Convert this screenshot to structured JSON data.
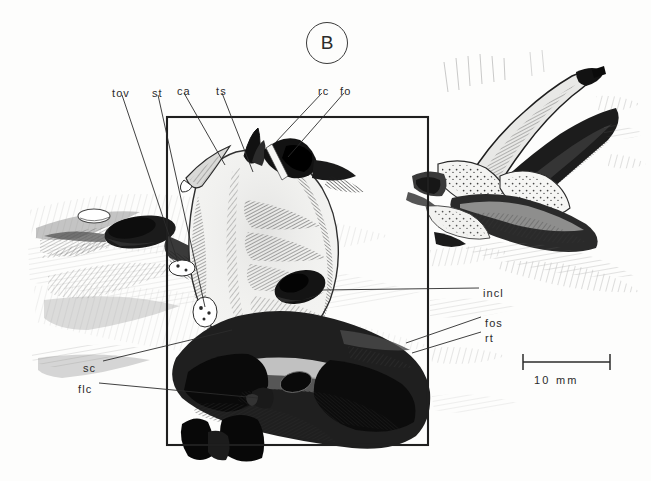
{
  "figure": {
    "panel_letter": "B",
    "caption_labels": [
      {
        "id": "tov",
        "text": "tov",
        "x": 112,
        "y": 88
      },
      {
        "id": "st",
        "text": "st",
        "x": 152,
        "y": 88
      },
      {
        "id": "ca",
        "text": "ca",
        "x": 177,
        "y": 86
      },
      {
        "id": "ts",
        "text": "ts",
        "x": 216,
        "y": 86
      },
      {
        "id": "rc",
        "text": "rc",
        "x": 318,
        "y": 86
      },
      {
        "id": "fo",
        "text": "fo",
        "x": 340,
        "y": 86
      },
      {
        "id": "incl",
        "text": "incl",
        "x": 483,
        "y": 288
      },
      {
        "id": "fos",
        "text": "fos",
        "x": 485,
        "y": 318
      },
      {
        "id": "rt",
        "text": "rt",
        "x": 485,
        "y": 333
      },
      {
        "id": "sc",
        "text": "sc",
        "x": 83,
        "y": 363
      },
      {
        "id": "flc",
        "text": "flc",
        "x": 78,
        "y": 384
      }
    ],
    "scale_bar": {
      "label": "10 mm",
      "x1": 523,
      "x2": 610,
      "y": 362,
      "text_x": 534,
      "text_y": 374
    },
    "frame_box": {
      "x": 167,
      "y": 117,
      "w": 261,
      "h": 328
    },
    "colors": {
      "ink": "#2b2b2b",
      "line": "#3a3a3a",
      "paper": "#fdfdfc",
      "shadow": "#6e6e6e",
      "deep_shadow": "#151515"
    },
    "leader_lines": [
      {
        "id": "tov",
        "x1": 122,
        "y1": 95,
        "x2": 178,
        "y2": 262
      },
      {
        "id": "st",
        "x1": 158,
        "y1": 95,
        "x2": 205,
        "y2": 307
      },
      {
        "id": "ca",
        "x1": 184,
        "y1": 93,
        "x2": 225,
        "y2": 165
      },
      {
        "id": "ts",
        "x1": 222,
        "y1": 93,
        "x2": 253,
        "y2": 172
      },
      {
        "id": "rc",
        "x1": 322,
        "y1": 93,
        "x2": 275,
        "y2": 143
      },
      {
        "id": "fo",
        "x1": 344,
        "y1": 93,
        "x2": 288,
        "y2": 157
      },
      {
        "id": "incl",
        "x1": 479,
        "y1": 288,
        "x2": 322,
        "y2": 290
      },
      {
        "id": "fos",
        "x1": 481,
        "y1": 317,
        "x2": 406,
        "y2": 343
      },
      {
        "id": "rt",
        "x1": 481,
        "y1": 332,
        "x2": 412,
        "y2": 353
      },
      {
        "id": "sc",
        "x1": 103,
        "y1": 361,
        "x2": 232,
        "y2": 330
      },
      {
        "id": "flc",
        "x1": 99,
        "y1": 383,
        "x2": 258,
        "y2": 398
      }
    ]
  }
}
